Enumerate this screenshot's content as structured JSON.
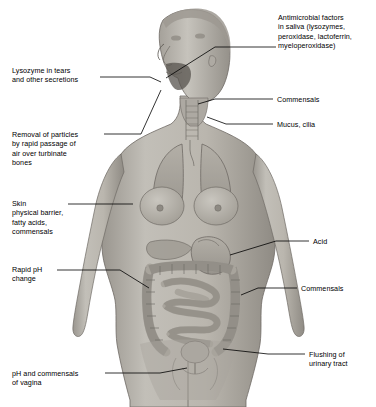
{
  "figure": {
    "background_color": "#ffffff",
    "body_fill": "#b9b5ad",
    "body_shade": "#8e8a83",
    "organ_fill": "#a8a49c",
    "line_color": "#000000"
  },
  "labels": [
    {
      "id": "saliva",
      "text": "Antimicrobial factors\nin saliva (lysozymes,\nperoxidase, lactoferrin,\nmyeloperoxidase)",
      "x": 278,
      "y": 17,
      "side": "right"
    },
    {
      "id": "lysozyme-tears",
      "text": "Lysozyme in tears\nand other secretions",
      "x": 12,
      "y": 70,
      "side": "left"
    },
    {
      "id": "commensals-upper",
      "text": "Commensals",
      "x": 276,
      "y": 95,
      "side": "right"
    },
    {
      "id": "mucus-cilia",
      "text": "Mucus, cilia",
      "x": 276,
      "y": 120,
      "side": "right"
    },
    {
      "id": "removal-particles",
      "text": "Removal of particles\nby rapid passage of\nair over turbinate\nbones",
      "x": 12,
      "y": 130,
      "side": "left"
    },
    {
      "id": "skin",
      "text": "Skin\nphysical barrier,\nfatty acids,\ncommensals",
      "x": 12,
      "y": 199,
      "side": "left"
    },
    {
      "id": "acid",
      "text": "Acid",
      "x": 312,
      "y": 237,
      "side": "right"
    },
    {
      "id": "rapid-ph",
      "text": "Rapid pH\nchange",
      "x": 12,
      "y": 265,
      "side": "left"
    },
    {
      "id": "commensals-lower",
      "text": "Commensals",
      "x": 300,
      "y": 284,
      "side": "right"
    },
    {
      "id": "flushing-urinary",
      "text": "Flushing of\nurinary tract",
      "x": 308,
      "y": 350,
      "side": "right"
    },
    {
      "id": "ph-commensals-vagina",
      "text": "pH and commensals\nof vagina",
      "x": 12,
      "y": 369,
      "side": "left"
    }
  ],
  "leader_lines": [
    {
      "id": "leader-saliva",
      "points": "276,47 215,47 165,78"
    },
    {
      "id": "leader-lysozyme-tears",
      "points": "100,77 150,77 160,82"
    },
    {
      "id": "leader-commensals-upper",
      "points": "273,99 215,99 197,104"
    },
    {
      "id": "leader-mucus-cilia",
      "points": "273,124 226,124 206,117"
    },
    {
      "id": "leader-removal-particles",
      "points": "104,134 140,134 160,90"
    },
    {
      "id": "leader-skin",
      "points": "68,204 132,204"
    },
    {
      "id": "leader-acid",
      "points": "309,241 276,241 229,256"
    },
    {
      "id": "leader-rapid-ph",
      "points": "57,270 120,270 148,288"
    },
    {
      "id": "leader-commensals-lower",
      "points": "297,288 258,288 240,295"
    },
    {
      "id": "leader-flushing-urinary",
      "points": "305,354 268,354 222,349"
    },
    {
      "id": "leader-ph-vagina",
      "points": "105,373 160,373 186,368"
    }
  ],
  "icons": {
    "figure": "human-body-anatomy-illustration"
  }
}
